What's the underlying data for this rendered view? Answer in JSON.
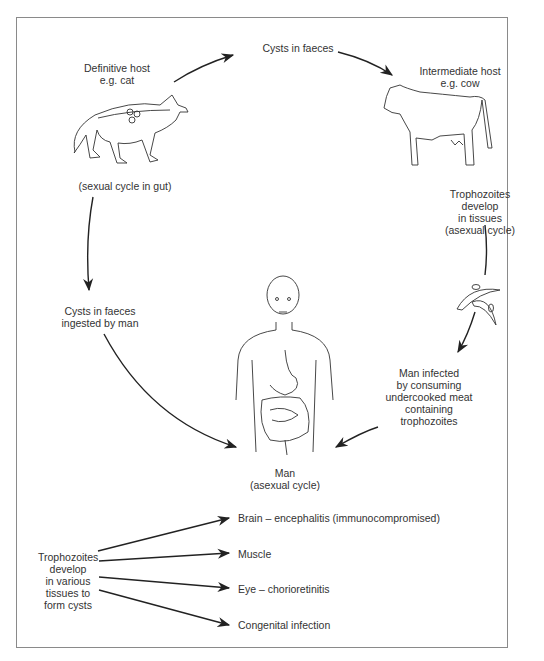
{
  "diagram": {
    "nodes": {
      "definitive_host": {
        "lines": [
          "Definitive host",
          "e.g. cat"
        ]
      },
      "sexual_cycle": {
        "lines": [
          "(sexual cycle in gut)"
        ]
      },
      "cysts_in_faeces": {
        "lines": [
          "Cysts in faeces"
        ]
      },
      "intermediate_host": {
        "lines": [
          "Intermediate host",
          "e.g. cow"
        ]
      },
      "trophozoites_tissues": {
        "lines": [
          "Trophozoites",
          "develop",
          "in tissues",
          "(asexual cycle)"
        ]
      },
      "cysts_ingested": {
        "lines": [
          "Cysts in faeces",
          "ingested by man"
        ]
      },
      "man_infected": {
        "lines": [
          "Man infected",
          "by consuming",
          "undercooked meat",
          "containing",
          "trophozoites"
        ]
      },
      "man": {
        "lines": [
          "Man",
          "(asexual cycle)"
        ]
      },
      "trophozoites_various": {
        "lines": [
          "Trophozoites",
          "develop",
          "in various",
          "tissues to",
          "form cysts"
        ]
      }
    },
    "outcomes": [
      "Brain – encephalitis (immunocompromised)",
      "Muscle",
      "Eye – chorioretinitis",
      "Congenital infection"
    ],
    "illustrations": [
      "cat-with-gut",
      "cow",
      "trophozoites",
      "human-torso-with-digestive-tract"
    ],
    "colors": {
      "line": "#222222",
      "border": "#8a8a8a",
      "text": "#333333"
    }
  }
}
